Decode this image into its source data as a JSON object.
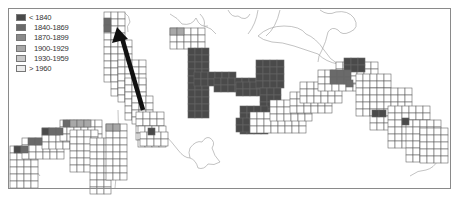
{
  "legend": {
    "items": [
      {
        "label": "< 1840",
        "color": "#4a4a4a"
      },
      {
        "label": "1840-1869",
        "color": "#6a6a6a"
      },
      {
        "label": "1870-1899",
        "color": "#8a8a8a"
      },
      {
        "label": "1900-1929",
        "color": "#a8a8a8"
      },
      {
        "label": "1930-1959",
        "color": "#c8c8c8"
      },
      {
        "label": "> 1960",
        "color": "#ececec"
      }
    ]
  },
  "map": {
    "frame_color": "#8a8a8a",
    "arrow_color": "#111111",
    "arrow": {
      "from": [
        143,
        110
      ],
      "to": [
        118,
        30
      ]
    },
    "cell_size": 7
  }
}
